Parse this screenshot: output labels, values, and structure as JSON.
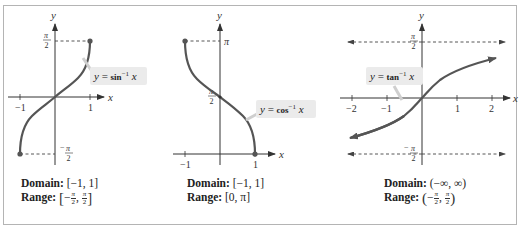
{
  "colors": {
    "curve": "#555555",
    "axis": "#333333",
    "dashed": "#444444",
    "label_box": "#ebebeb",
    "frame": "#b4b4b4"
  },
  "graphs": [
    {
      "id": "arcsin",
      "axis_labels": {
        "x": "x",
        "y": "y"
      },
      "curve_label": {
        "prefix": "y = ",
        "func": "sin",
        "sup": "−1",
        "var": " x"
      },
      "x_ticks": [
        "−1",
        "1"
      ],
      "y_ticks": [
        {
          "num": "π",
          "den": "2",
          "sign": ""
        },
        {
          "num": "π",
          "den": "2",
          "sign": "−"
        }
      ],
      "domain_label": "Domain:",
      "domain_value": "[−1, 1]",
      "range_label": "Range:",
      "range_value": {
        "open": "[",
        "a_sign": "−",
        "a_num": "π",
        "a_den": "2",
        "sep": ",",
        "b_num": "π",
        "b_den": "2",
        "close": "]"
      }
    },
    {
      "id": "arccos",
      "axis_labels": {
        "x": "x",
        "y": "y"
      },
      "curve_label": {
        "prefix": "y = ",
        "func": "cos",
        "sup": "−1",
        "var": " x"
      },
      "x_ticks": [
        "−1",
        "1"
      ],
      "y_ticks": [
        {
          "text": "π"
        },
        {
          "num": "π",
          "den": "2"
        }
      ],
      "domain_label": "Domain:",
      "domain_value": "[−1, 1]",
      "range_label": "Range:",
      "range_value_text": "[0, π]"
    },
    {
      "id": "arctan",
      "axis_labels": {
        "x": "x",
        "y": "y"
      },
      "curve_label": {
        "prefix": "y = ",
        "func": "tan",
        "sup": "−1",
        "var": " x"
      },
      "x_ticks": [
        "−2",
        "−1",
        "1",
        "2"
      ],
      "y_ticks": [
        {
          "num": "π",
          "den": "2",
          "sign": ""
        },
        {
          "num": "π",
          "den": "2",
          "sign": "−"
        }
      ],
      "domain_label": "Domain:",
      "domain_value": "(−∞, ∞)",
      "range_label": "Range:",
      "range_value": {
        "open": "(",
        "a_sign": "−",
        "a_num": "π",
        "a_den": "2",
        "sep": ",",
        "b_num": "π",
        "b_den": "2",
        "close": ")"
      }
    }
  ]
}
